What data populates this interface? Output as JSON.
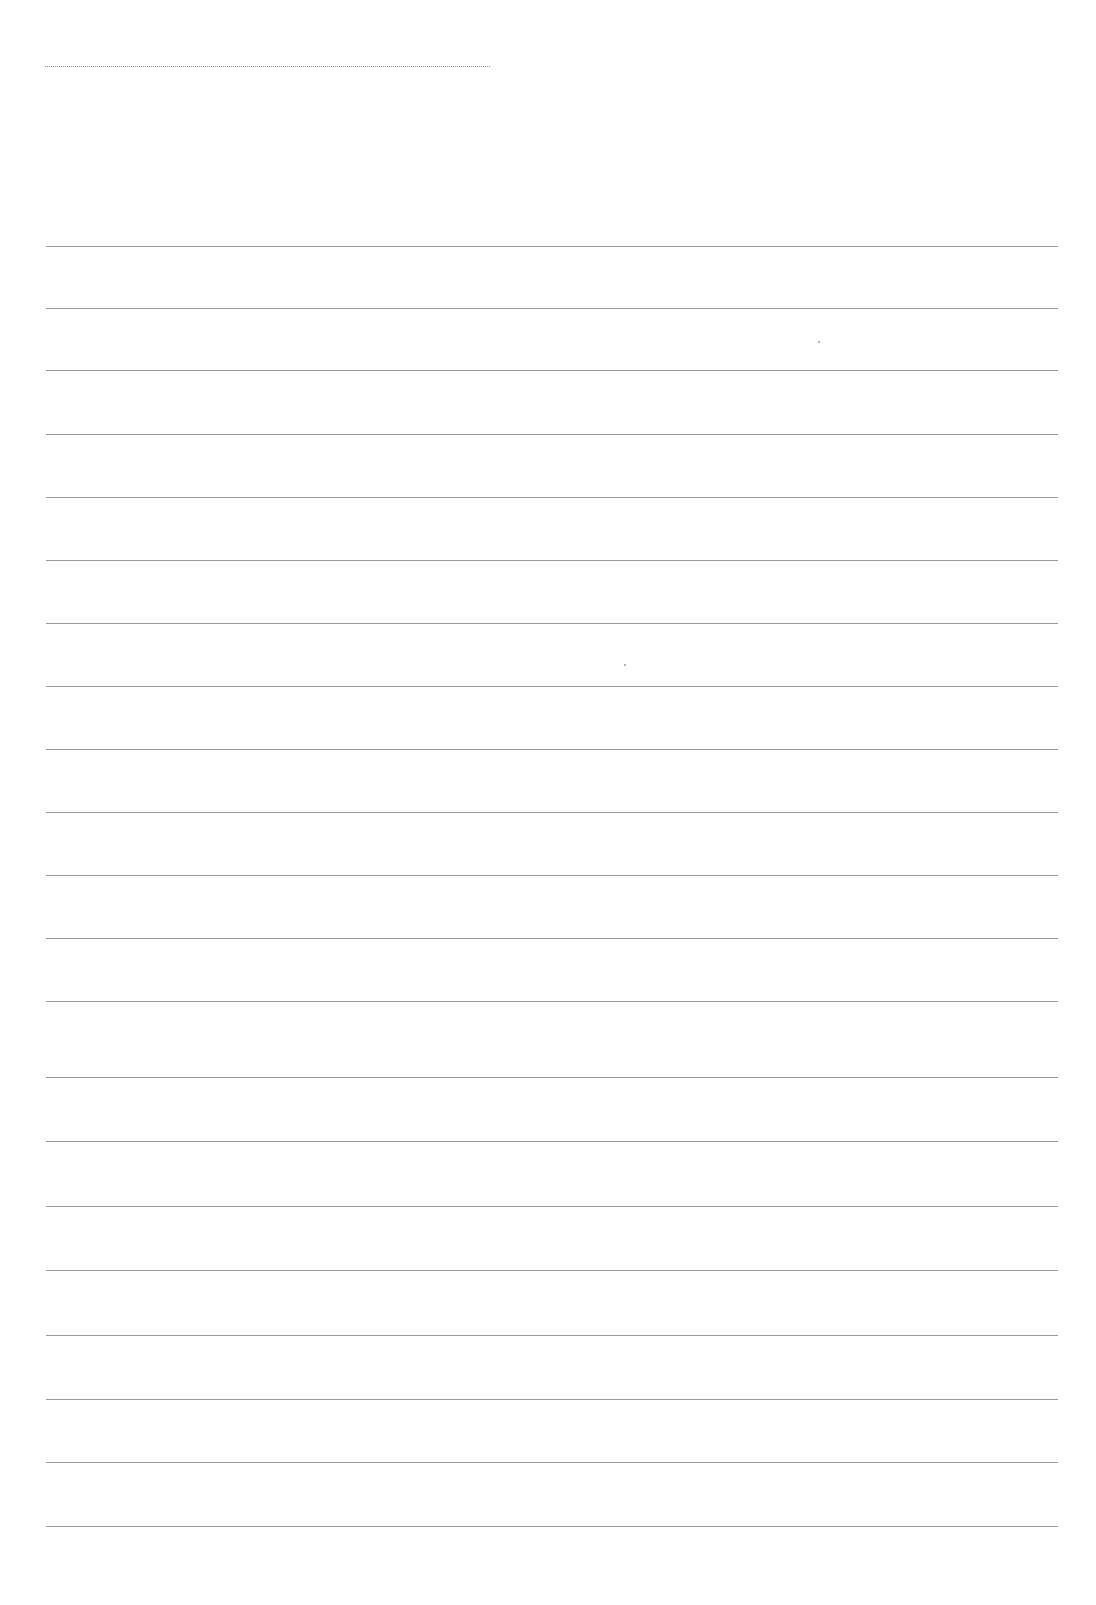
{
  "document": {
    "type": "blank ruled writing sheet",
    "title_line": {
      "x1": 45,
      "x2": 490,
      "y": 66,
      "style": "dotted"
    },
    "ruled_lines": {
      "count": 21,
      "x1": 46,
      "x2": 1058,
      "first_y": 246,
      "spacing": 64,
      "ys": [
        246,
        308,
        370,
        434,
        497,
        560,
        623,
        686,
        749,
        812,
        875,
        938,
        1001,
        1077,
        1141,
        1206,
        1270,
        1335,
        1399,
        1462,
        1526
      ]
    },
    "line_color": "#9a9a9a",
    "background_color": "#ffffff",
    "scan_specks": [
      {
        "x": 818,
        "y": 341
      },
      {
        "x": 624,
        "y": 664
      }
    ]
  }
}
